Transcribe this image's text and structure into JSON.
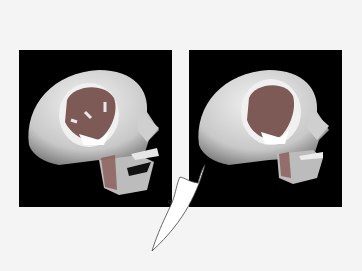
{
  "figure": {
    "panels": [
      {
        "id": "left",
        "label": "skull-with-contraction-arrows",
        "arrows": 4,
        "jaw": "open"
      },
      {
        "id": "right",
        "label": "skull-at-rest",
        "arrows": 0,
        "jaw": "closed"
      }
    ],
    "callout": "curved pointer shape between panels"
  },
  "colors": {
    "background": "#f4f4f4",
    "panel_bg": "#000000",
    "bone": "#d8d8d8",
    "muscle": "#8a5a55",
    "tendon": "#ffffff"
  }
}
